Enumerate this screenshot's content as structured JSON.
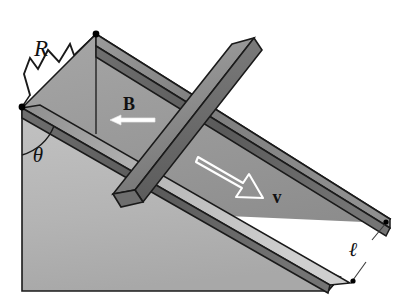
{
  "figure": {
    "background_color": "#ffffff",
    "width": 415,
    "height": 307
  },
  "labels": {
    "resistor": "R",
    "magnetic_field": "B",
    "velocity": "v",
    "incline_angle": "θ",
    "rail_separation": "ℓ"
  },
  "colors": {
    "incline_surface": "#949494",
    "wedge_front_face": "#b4b4b4",
    "rail_top": "#828282",
    "rail_side_dark": "#5e5e5e",
    "bar_top": "#8c8c8c",
    "bar_side": "#6a6a6a",
    "outline": "#1a1a1a",
    "arrow_stroke": "#ffffff",
    "label_color": "#111111",
    "node_dot": "#000000"
  },
  "elements": {
    "incline_name": "inclined-plane-wedge",
    "rail_upper_name": "conducting-rail-upper",
    "rail_lower_name": "conducting-rail-lower",
    "bar_name": "sliding-conducting-bar",
    "resistor_name": "resistor-zigzag",
    "b_arrow_name": "magnetic-field-arrow",
    "v_arrow_name": "velocity-arrow",
    "angle_arc_name": "incline-angle-arc",
    "dimension_name": "rail-separation-dimension"
  }
}
